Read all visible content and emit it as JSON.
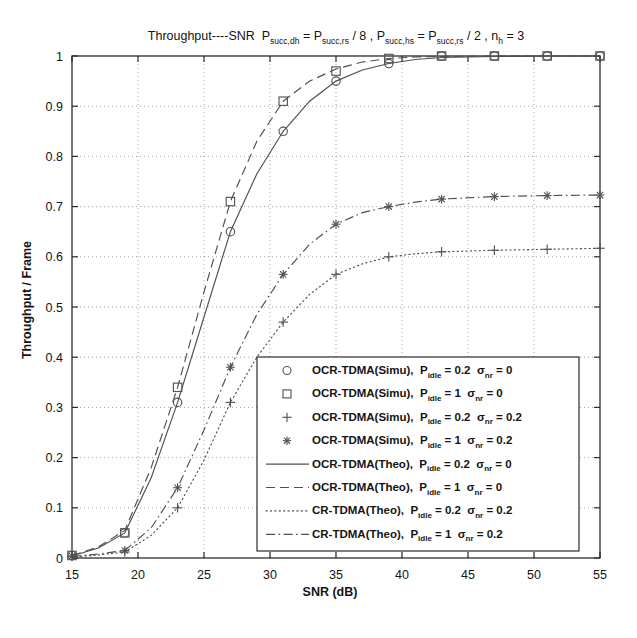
{
  "chart_data": {
    "type": "line",
    "title_parts": {
      "lead": "Throughput",
      "dashes": "----",
      "snr": "SNR",
      "p1_base": "P",
      "p1_sub": "succ,dh",
      "eq1": "= P",
      "p2_sub": "succ,rs",
      "div1": "/ 8 ,",
      "p3_base": "P",
      "p3_sub": "succ,hs",
      "eq2": "= P",
      "p4_sub": "succ,rs",
      "div2": "/ 2 ,",
      "n_base": "n",
      "n_sub": "h",
      "n_eq": "= 3"
    },
    "xlabel": "SNR (dB)",
    "ylabel": "Throughput / Frame",
    "xlim": [
      15,
      55
    ],
    "ylim": [
      0,
      1
    ],
    "xticks": [
      15,
      20,
      25,
      30,
      35,
      40,
      45,
      50,
      55
    ],
    "xtick_labels": [
      "15",
      "20",
      "25",
      "30",
      "35",
      "40",
      "45",
      "50",
      "55"
    ],
    "yticks": [
      0,
      0.1,
      0.2,
      0.3,
      0.4,
      0.5,
      0.6,
      0.7,
      0.8,
      0.9,
      1
    ],
    "ytick_labels": [
      "0",
      "0.1",
      "0.2",
      "0.3",
      "0.4",
      "0.5",
      "0.6",
      "0.7",
      "0.8",
      "0.9",
      "1"
    ],
    "grid": true,
    "legend_position": "lower-right",
    "series": [
      {
        "name": "OCR-TDMA(Simu), P_idle = 0.2  sigma_nr = 0",
        "marker": "circle",
        "linestyle": "none",
        "x": [
          15,
          19,
          23,
          27,
          31,
          35,
          39,
          43,
          47,
          51,
          55
        ],
        "values": [
          0.005,
          0.05,
          0.31,
          0.65,
          0.85,
          0.95,
          0.985,
          1.0,
          1.0,
          1.0,
          1.0
        ]
      },
      {
        "name": "OCR-TDMA(Simu), P_idle = 1  sigma_nr = 0",
        "marker": "square",
        "linestyle": "none",
        "x": [
          15,
          19,
          23,
          27,
          31,
          35,
          39,
          43,
          47,
          51,
          55
        ],
        "values": [
          0.005,
          0.05,
          0.34,
          0.71,
          0.91,
          0.97,
          0.995,
          1.0,
          1.0,
          1.0,
          1.0
        ]
      },
      {
        "name": "OCR-TDMA(Simu), P_idle = 0.2  sigma_nr = 0.2",
        "marker": "plus",
        "linestyle": "none",
        "x": [
          15,
          19,
          23,
          27,
          31,
          35,
          39,
          43,
          47,
          51,
          55
        ],
        "values": [
          0.003,
          0.012,
          0.1,
          0.31,
          0.47,
          0.565,
          0.6,
          0.61,
          0.613,
          0.615,
          0.617
        ]
      },
      {
        "name": "OCR-TDMA(Simu), P_idle = 1  sigma_nr = 0.2",
        "marker": "asterisk",
        "linestyle": "none",
        "x": [
          15,
          19,
          23,
          27,
          31,
          35,
          39,
          43,
          47,
          51,
          55
        ],
        "values": [
          0.004,
          0.015,
          0.14,
          0.38,
          0.565,
          0.665,
          0.7,
          0.715,
          0.72,
          0.722,
          0.723
        ]
      },
      {
        "name": "OCR-TDMA(Theo), P_idle = 0.2  sigma_nr = 0",
        "marker": "none",
        "linestyle": "solid",
        "x": [
          15,
          17,
          19,
          21,
          23,
          25,
          27,
          29,
          31,
          33,
          35,
          37,
          39,
          41,
          43,
          47,
          51,
          55
        ],
        "values": [
          0.004,
          0.02,
          0.05,
          0.16,
          0.31,
          0.48,
          0.65,
          0.765,
          0.85,
          0.91,
          0.95,
          0.972,
          0.985,
          0.993,
          0.997,
          0.999,
          1.0,
          1.0
        ]
      },
      {
        "name": "OCR-TDMA(Theo), P_idle = 1  sigma_nr = 0",
        "marker": "none",
        "linestyle": "dashed",
        "x": [
          15,
          17,
          19,
          21,
          23,
          25,
          27,
          29,
          31,
          33,
          35,
          37,
          39,
          41,
          43,
          47,
          51,
          55
        ],
        "values": [
          0.005,
          0.022,
          0.055,
          0.18,
          0.34,
          0.53,
          0.71,
          0.83,
          0.91,
          0.95,
          0.974,
          0.988,
          0.995,
          0.998,
          0.999,
          1.0,
          1.0,
          1.0
        ]
      },
      {
        "name": "CR-TDMA(Theo), P_idle = 0.2  sigma_nr = 0.2",
        "marker": "none",
        "linestyle": "dotted",
        "x": [
          15,
          17,
          19,
          21,
          23,
          25,
          27,
          29,
          31,
          33,
          35,
          37,
          39,
          41,
          43,
          47,
          51,
          55
        ],
        "values": [
          0.002,
          0.006,
          0.012,
          0.045,
          0.1,
          0.195,
          0.31,
          0.4,
          0.47,
          0.525,
          0.565,
          0.586,
          0.6,
          0.606,
          0.61,
          0.613,
          0.615,
          0.617
        ]
      },
      {
        "name": "CR-TDMA(Theo), P_idle = 1  sigma_nr = 0.2",
        "marker": "none",
        "linestyle": "dashdot",
        "x": [
          15,
          17,
          19,
          21,
          23,
          25,
          27,
          29,
          31,
          33,
          35,
          37,
          39,
          41,
          43,
          47,
          51,
          55
        ],
        "values": [
          0.003,
          0.008,
          0.015,
          0.06,
          0.14,
          0.255,
          0.38,
          0.485,
          0.565,
          0.625,
          0.665,
          0.688,
          0.7,
          0.709,
          0.715,
          0.72,
          0.722,
          0.723
        ]
      }
    ]
  },
  "legend": {
    "items": [
      {
        "marker": "circle",
        "label": "OCR-TDMA(Simu),",
        "p_base": "P",
        "p_sub": "idle",
        "p_val": "= 0.2",
        "s_base": "σ",
        "s_sub": "nr",
        "s_val": "= 0"
      },
      {
        "marker": "square",
        "label": "OCR-TDMA(Simu),",
        "p_base": "P",
        "p_sub": "idle",
        "p_val": "= 1",
        "s_base": "σ",
        "s_sub": "nr",
        "s_val": "= 0"
      },
      {
        "marker": "plus",
        "label": "OCR-TDMA(Simu),",
        "p_base": "P",
        "p_sub": "idle",
        "p_val": "= 0.2",
        "s_base": "σ",
        "s_sub": "nr",
        "s_val": "= 0.2"
      },
      {
        "marker": "asterisk",
        "label": "OCR-TDMA(Simu),",
        "p_base": "P",
        "p_sub": "idle",
        "p_val": "= 1",
        "s_base": "σ",
        "s_sub": "nr",
        "s_val": "= 0.2"
      },
      {
        "marker": "solid",
        "label": "OCR-TDMA(Theo),",
        "p_base": "P",
        "p_sub": "idle",
        "p_val": "= 0.2",
        "s_base": "σ",
        "s_sub": "nr",
        "s_val": "= 0"
      },
      {
        "marker": "dashed",
        "label": "OCR-TDMA(Theo),",
        "p_base": "P",
        "p_sub": "idle",
        "p_val": "= 1",
        "s_base": "σ",
        "s_sub": "nr",
        "s_val": "= 0"
      },
      {
        "marker": "dotted",
        "label": "CR-TDMA(Theo),",
        "p_base": "P",
        "p_sub": "idle",
        "p_val": "= 0.2",
        "s_base": "σ",
        "s_sub": "nr",
        "s_val": "= 0.2"
      },
      {
        "marker": "dashdot",
        "label": "CR-TDMA(Theo),",
        "p_base": "P",
        "p_sub": "idle",
        "p_val": "= 1",
        "s_base": "σ",
        "s_sub": "nr",
        "s_val": "= 0.2"
      }
    ]
  },
  "colors": {
    "line": "#4f4f4f",
    "axis": "#2b2b2b",
    "grid": "#8c8c8c",
    "text": "#141414",
    "background": "#ffffff"
  }
}
